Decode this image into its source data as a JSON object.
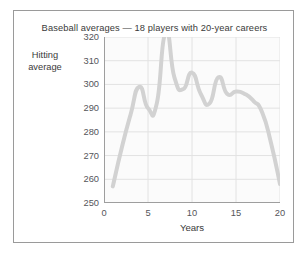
{
  "figure": {
    "title": "Baseball averages — 18 players with 20-year careers",
    "background": "#ffffff",
    "border_color": "#9a9a9a",
    "plot_background": "#fbfbfb"
  },
  "chart_data": {
    "type": "line",
    "title": "Baseball averages — 18 players with 20-year careers",
    "xlabel": "Years",
    "ylabel": "Hitting average",
    "ylabel_lines": [
      "Hitting",
      "average"
    ],
    "xlim": [
      0,
      20
    ],
    "ylim": [
      250,
      320
    ],
    "xticks": [
      0,
      5,
      10,
      15,
      20
    ],
    "xtick_labels": [
      "0",
      "5",
      "10",
      "15",
      "20"
    ],
    "yticks": [
      250,
      260,
      270,
      280,
      290,
      300,
      310,
      320
    ],
    "ytick_labels": [
      "250",
      "260",
      "270",
      "280",
      "290",
      "300",
      "310",
      "320"
    ],
    "grid": true,
    "grid_color": "#e2e2e2",
    "legend": null,
    "line_color": "#d2d2d2",
    "line_width": 4,
    "series": [
      {
        "name": "Hitting average",
        "x": [
          1,
          2,
          3,
          4,
          5,
          6,
          7,
          8,
          9,
          10,
          11,
          12,
          13,
          14,
          15,
          16,
          17,
          18,
          19,
          20
        ],
        "values": [
          257,
          273,
          287,
          299,
          290,
          292,
          322,
          303,
          298,
          305,
          296,
          292,
          303,
          296,
          297,
          296,
          293,
          288,
          275,
          258
        ]
      }
    ]
  }
}
